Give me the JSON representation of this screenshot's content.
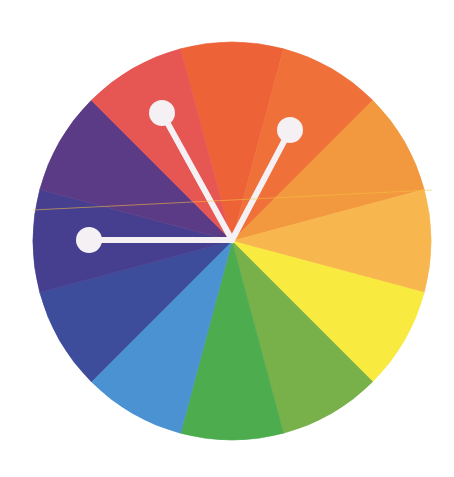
{
  "diagram": {
    "type": "color-wheel",
    "scheme": "split-complementary-like three-pointer selection",
    "center": {
      "x": 232,
      "y": 241
    },
    "radius": 199,
    "segments": [
      {
        "name": "red-orange",
        "color": "#EE6238",
        "start": -15,
        "end": 15
      },
      {
        "name": "orange-red",
        "color": "#F0703A",
        "start": 15,
        "end": 45
      },
      {
        "name": "orange",
        "color": "#F2983E",
        "start": 45,
        "end": 75
      },
      {
        "name": "yellow-orange",
        "color": "#F8B74E",
        "start": 75,
        "end": 105
      },
      {
        "name": "yellow",
        "color": "#F8EA3E",
        "start": 105,
        "end": 135
      },
      {
        "name": "yellow-green",
        "color": "#78B04A",
        "start": 135,
        "end": 165
      },
      {
        "name": "green",
        "color": "#4CAC4E",
        "start": 165,
        "end": 195
      },
      {
        "name": "blue",
        "color": "#4A92D2",
        "start": 195,
        "end": 225
      },
      {
        "name": "blue-violet",
        "color": "#3E4C9C",
        "start": 225,
        "end": 255
      },
      {
        "name": "indigo",
        "color": "#463E8E",
        "start": 255,
        "end": 285
      },
      {
        "name": "violet",
        "color": "#5B3A86",
        "start": 285,
        "end": 315
      },
      {
        "name": "red",
        "color": "#E65652",
        "start": 315,
        "end": 345
      }
    ],
    "pointers": [
      {
        "name": "pointer-left",
        "x": 89,
        "y": 240
      },
      {
        "name": "pointer-top-left",
        "x": 162,
        "y": 113
      },
      {
        "name": "pointer-top-right",
        "x": 290,
        "y": 130
      }
    ],
    "pointer_color": "#F4F0F4",
    "pointer_knob_radius": 13,
    "pointer_line_width": 6
  }
}
